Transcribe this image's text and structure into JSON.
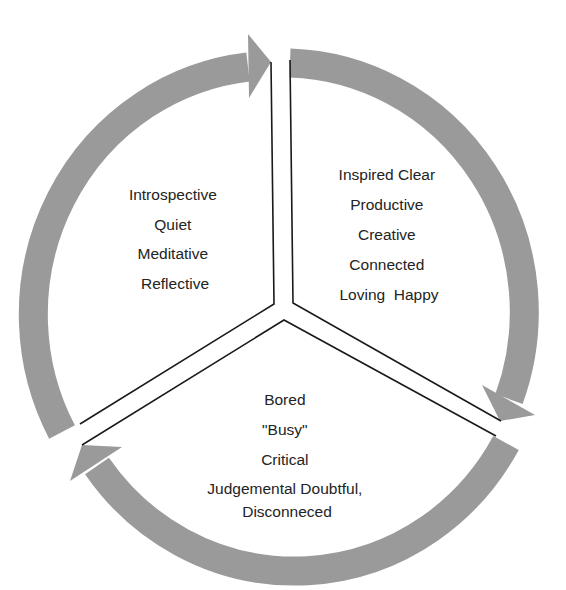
{
  "diagram": {
    "type": "cycle",
    "colors": {
      "ring": "#9a9a9a",
      "divider": "#1a1a1a",
      "text": "#232323",
      "background": "#ffffff"
    },
    "segments": [
      {
        "id": "top-left",
        "lines": [
          "Introspective",
          "Quiet",
          "Meditative",
          "Reflective"
        ]
      },
      {
        "id": "right",
        "lines": [
          "Inspired Clear",
          "Productive",
          "Creative",
          "Connected",
          "Loving  Happy"
        ]
      },
      {
        "id": "bottom",
        "lines": [
          "Bored",
          "\"Busy\"",
          "Critical",
          "Judgemental Doubtful,",
          "Disconneced"
        ]
      }
    ],
    "arrows": [
      {
        "from": "top-left",
        "to": "right",
        "icon": "arrow-clockwise-icon"
      },
      {
        "from": "right",
        "to": "bottom",
        "icon": "arrow-clockwise-icon"
      },
      {
        "from": "bottom",
        "to": "top-left",
        "icon": "arrow-clockwise-icon"
      }
    ]
  }
}
